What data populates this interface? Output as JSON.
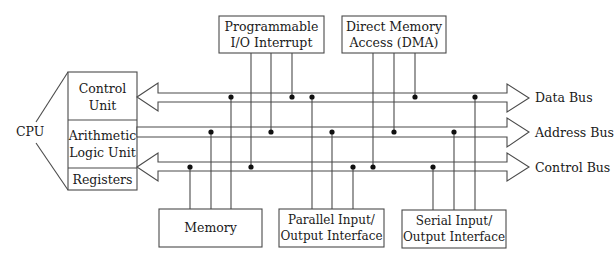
{
  "diagram": {
    "title": "",
    "cpu": {
      "label": "CPU",
      "units": [
        {
          "line1": "Control",
          "line2": "Unit"
        },
        {
          "line1": "Arithmetic",
          "line2": "Logic Unit"
        },
        {
          "line1": "Registers",
          "line2": ""
        }
      ]
    },
    "top_devices": [
      {
        "line1": "Programmable",
        "line2": "I/O Interrupt"
      },
      {
        "line1": "Direct Memory",
        "line2": "Access (DMA)"
      }
    ],
    "bottom_devices": [
      {
        "line1": "Memory",
        "line2": ""
      },
      {
        "line1": "Parallel Input/",
        "line2": "Output Interface"
      },
      {
        "line1": "Serial Input/",
        "line2": "Output Interface"
      }
    ],
    "buses": [
      {
        "label": "Data Bus",
        "direction": "bidirectional"
      },
      {
        "label": "Address Bus",
        "direction": "unidirectional"
      },
      {
        "label": "Control Bus",
        "direction": "bidirectional"
      }
    ],
    "connections": {
      "Programmable I/O Interrupt": [
        "Control Bus",
        "Address Bus",
        "Data Bus"
      ],
      "Direct Memory Access (DMA)": [
        "Control Bus",
        "Address Bus",
        "Data Bus"
      ],
      "Memory": [
        "Control Bus",
        "Address Bus",
        "Data Bus"
      ],
      "Parallel Input/Output Interface": [
        "Data Bus",
        "Address Bus",
        "Control Bus"
      ],
      "Serial Input/Output Interface": [
        "Control Bus",
        "Address Bus",
        "Data Bus"
      ]
    },
    "colors": {
      "line": "#4a4a4a",
      "dot": "#111111",
      "background": "#ffffff"
    }
  }
}
